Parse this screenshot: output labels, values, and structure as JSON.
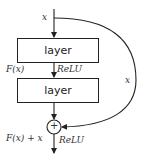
{
  "diagram": {
    "input_label": "x",
    "layer1_label": "layer",
    "layer2_label": "layer",
    "fx_label": "F(x)",
    "relu1_label": "ReLU",
    "skip_label": "x",
    "sum_symbol": "+",
    "output_label": "F(x) + x",
    "relu2_label": "ReLU",
    "colors": {
      "stroke": "#222222",
      "background": "#ffffff"
    }
  }
}
